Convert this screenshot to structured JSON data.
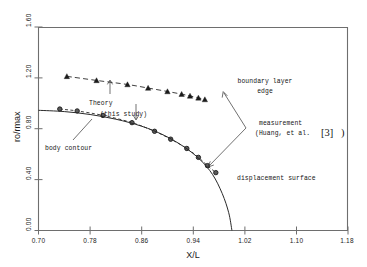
{
  "chart_data": {
    "type": "line",
    "title": "",
    "xlabel": "X/L",
    "ylabel": "ro/rmax",
    "xlim": [
      0.7,
      1.18
    ],
    "ylim": [
      0.0,
      1.6
    ],
    "xticks": [
      "0.70",
      "0.78",
      "0.86",
      "0.94",
      "1.02",
      "1.10",
      "1.18"
    ],
    "xtick_values": [
      0.7,
      0.78,
      0.86,
      0.94,
      1.02,
      1.1,
      1.18
    ],
    "yticks": [
      "0.00",
      "0.40",
      "0.80",
      "1.20",
      "1.60"
    ],
    "ytick_values": [
      0.0,
      0.4,
      0.8,
      1.2,
      1.6
    ],
    "grid": false,
    "legend": "none",
    "series": [
      {
        "name": "boundary layer edge",
        "style": "dashed",
        "marker": "triangle",
        "x": [
          0.744,
          0.79,
          0.838,
          0.87,
          0.9,
          0.922,
          0.935,
          0.948,
          0.958
        ],
        "y": [
          1.212,
          1.18,
          1.148,
          1.12,
          1.093,
          1.072,
          1.058,
          1.043,
          1.03
        ]
      },
      {
        "name": "displacement surface",
        "style": "dotted",
        "marker": "circle",
        "x": [
          0.733,
          0.76,
          0.8,
          0.845,
          0.88,
          0.905,
          0.93,
          0.948,
          0.962,
          0.975
        ],
        "y": [
          0.955,
          0.94,
          0.905,
          0.848,
          0.78,
          0.718,
          0.645,
          0.575,
          0.51,
          0.455
        ]
      },
      {
        "name": "body contour",
        "style": "solid",
        "marker": "none",
        "x": [
          0.7,
          0.74,
          0.78,
          0.82,
          0.86,
          0.895,
          0.925,
          0.95,
          0.97,
          0.985,
          0.995,
          1.0
        ],
        "y": [
          0.945,
          0.935,
          0.912,
          0.875,
          0.82,
          0.748,
          0.66,
          0.56,
          0.44,
          0.29,
          0.14,
          0.0
        ]
      }
    ],
    "annotations": [
      {
        "name": "boundary-layer-edge",
        "line1": "boundary layer",
        "line2": "edge"
      },
      {
        "name": "theory-this-study",
        "line1": "Theory",
        "line2": "(this study)"
      },
      {
        "name": "measurement-huang",
        "line1": "measurement",
        "line2": "(Huang, et al.",
        "reference": "[3]",
        "closing": ")"
      },
      {
        "name": "body-contour",
        "line1": "body contour"
      },
      {
        "name": "displacement-surface",
        "line1": "displacement surface"
      }
    ],
    "colors": {
      "axis": "#6e6e6e",
      "curve": "#2a2a2a",
      "text": "#1a1a1a",
      "background": "#ffffff"
    }
  }
}
